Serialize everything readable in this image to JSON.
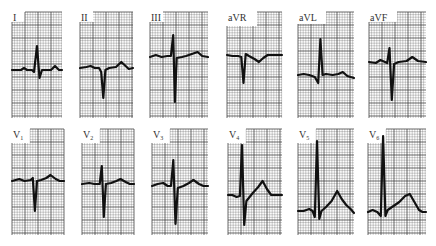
{
  "figure": {
    "colors": {
      "background": "#ffffff",
      "grid": "#3a3a3a",
      "trace": "#111111",
      "label": "#333333"
    },
    "leads": [
      {
        "id": "I",
        "label": "I",
        "sub": "",
        "row": 0,
        "col": 0,
        "morphology": "small-r-s-upright-t"
      },
      {
        "id": "II",
        "label": "II",
        "sub": "",
        "row": 0,
        "col": 1,
        "morphology": "deep-q-upright-t"
      },
      {
        "id": "III",
        "label": "III",
        "sub": "",
        "row": 0,
        "col": 2,
        "morphology": "tall-rS-upright-t"
      },
      {
        "id": "aVR",
        "label": "aVR",
        "sub": "",
        "row": 0,
        "col": 3,
        "morphology": "qs-inverted-t"
      },
      {
        "id": "aVL",
        "label": "aVL",
        "sub": "",
        "row": 0,
        "col": 4,
        "morphology": "tall-r-upright-t"
      },
      {
        "id": "aVF",
        "label": "aVF",
        "sub": "",
        "row": 0,
        "col": 5,
        "morphology": "rS-upright-t"
      },
      {
        "id": "V1",
        "label": "V",
        "sub": "1",
        "row": 1,
        "col": 0,
        "morphology": "rS-upright-t"
      },
      {
        "id": "V2",
        "label": "V",
        "sub": "2",
        "row": 1,
        "col": 1,
        "morphology": "rS-upright-t"
      },
      {
        "id": "V3",
        "label": "V",
        "sub": "3",
        "row": 1,
        "col": 2,
        "morphology": "RS-upright-t"
      },
      {
        "id": "V4",
        "label": "V",
        "sub": "4",
        "row": 1,
        "col": 3,
        "morphology": "tall-R-upright-t"
      },
      {
        "id": "V5",
        "label": "V",
        "sub": "5",
        "row": 1,
        "col": 4,
        "morphology": "tall-R-upright-t"
      },
      {
        "id": "V6",
        "label": "V",
        "sub": "6",
        "row": 1,
        "col": 5,
        "morphology": "tall-R-upright-t"
      }
    ]
  }
}
